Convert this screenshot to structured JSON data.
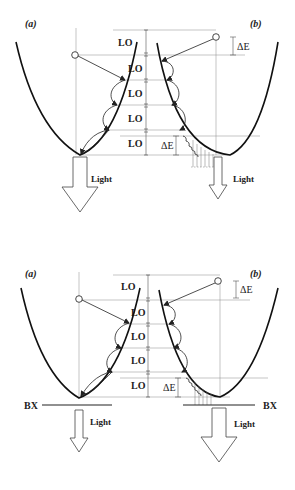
{
  "figure": {
    "top_panel": {
      "label_a": "(a)",
      "label_b": "(b)",
      "lo_labels": [
        "LO",
        "LO",
        "LO",
        "LO",
        "LO"
      ],
      "delta_e_right": "ΔE",
      "delta_e_bottom": "ΔE",
      "light_left": "Light",
      "light_right": "Light"
    },
    "bottom_panel": {
      "label_a": "(a)",
      "label_b": "(b)",
      "lo_labels": [
        "LO",
        "LO",
        "LO",
        "LO",
        "LO"
      ],
      "delta_e_right": "ΔE",
      "delta_e_bottom": "ΔE",
      "light_left": "Light",
      "light_right": "Light",
      "bx_left": "BX",
      "bx_right": "BX"
    }
  }
}
